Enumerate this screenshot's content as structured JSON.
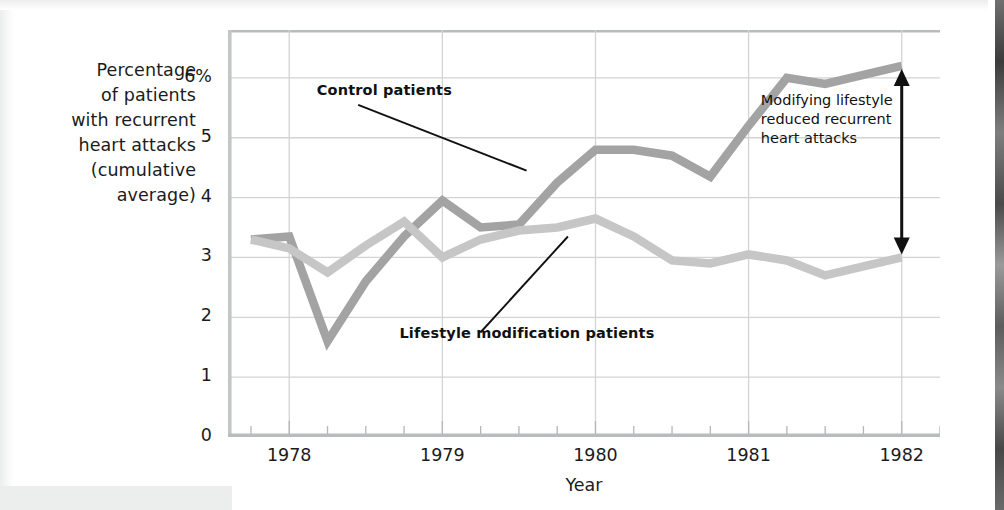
{
  "chart_data": {
    "type": "line",
    "title": "",
    "xlabel": "Year",
    "ylabel": "Percentage of patients with recurrent heart attacks (cumulative average)",
    "ylabel_lines": [
      "Percentage",
      "of patients",
      "with recurrent",
      "heart attacks",
      "(cumulative",
      "average)"
    ],
    "ylim": [
      0,
      6.8
    ],
    "xlim": [
      1977.6,
      1982.25
    ],
    "grid": true,
    "legend_position": "inline-annotations",
    "y_ticks": [
      "0",
      "1",
      "2",
      "3",
      "4",
      "5",
      "6%"
    ],
    "y_tick_values": [
      0,
      1,
      2,
      3,
      4,
      5,
      6
    ],
    "x_ticks": [
      "1978",
      "1979",
      "1980",
      "1981",
      "1982"
    ],
    "x_tick_values": [
      1978,
      1979,
      1980,
      1981,
      1982
    ],
    "x_minor_ticks_per_year": 4,
    "series": [
      {
        "name": "Control patients",
        "color": "#a3a3a3",
        "x": [
          1977.75,
          1978.0,
          1978.25,
          1978.5,
          1978.75,
          1979.0,
          1979.25,
          1979.5,
          1979.75,
          1980.0,
          1980.25,
          1980.5,
          1980.75,
          1981.0,
          1981.25,
          1981.5,
          1981.75,
          1982.0
        ],
        "values": [
          3.3,
          3.35,
          1.6,
          2.6,
          3.35,
          3.95,
          3.5,
          3.55,
          4.25,
          4.8,
          4.8,
          4.7,
          4.35,
          5.2,
          6.0,
          5.9,
          6.05,
          6.2
        ]
      },
      {
        "name": "Lifestyle modification patients",
        "color": "#c6c6c6",
        "x": [
          1977.75,
          1978.0,
          1978.25,
          1978.5,
          1978.75,
          1979.0,
          1979.25,
          1979.5,
          1979.75,
          1980.0,
          1980.25,
          1980.5,
          1980.75,
          1981.0,
          1981.25,
          1981.5,
          1981.75,
          1982.0
        ],
        "values": [
          3.3,
          3.15,
          2.75,
          3.2,
          3.6,
          3.0,
          3.3,
          3.45,
          3.5,
          3.65,
          3.35,
          2.95,
          2.9,
          3.05,
          2.95,
          2.7,
          2.85,
          3.0
        ]
      }
    ],
    "annotations": [
      {
        "id": "control-callout",
        "text": "Control patients",
        "bold": true,
        "leader_from": [
          1978.45,
          5.55
        ],
        "leader_to": [
          1979.55,
          4.45
        ]
      },
      {
        "id": "lifestyle-callout",
        "text": "Lifestyle modification patients",
        "bold": true,
        "leader_from": [
          1979.25,
          1.75
        ],
        "leader_to": [
          1979.82,
          3.35
        ]
      },
      {
        "id": "difference-callout",
        "text": "Modifying lifestyle\nreduced recurrent\nheart attacks",
        "bold": false,
        "arrow_x": 1982.0,
        "arrow_top": 6.15,
        "arrow_bottom": 3.05,
        "arrow_style": "double-headed-vertical"
      }
    ],
    "colors": {
      "control_line": "#a3a3a3",
      "lifestyle_line": "#c6c6c6",
      "grid": "#d2d4d4",
      "axis": "#c9cbcb",
      "text": "#1b1b1b",
      "background": "#ffffff"
    }
  }
}
